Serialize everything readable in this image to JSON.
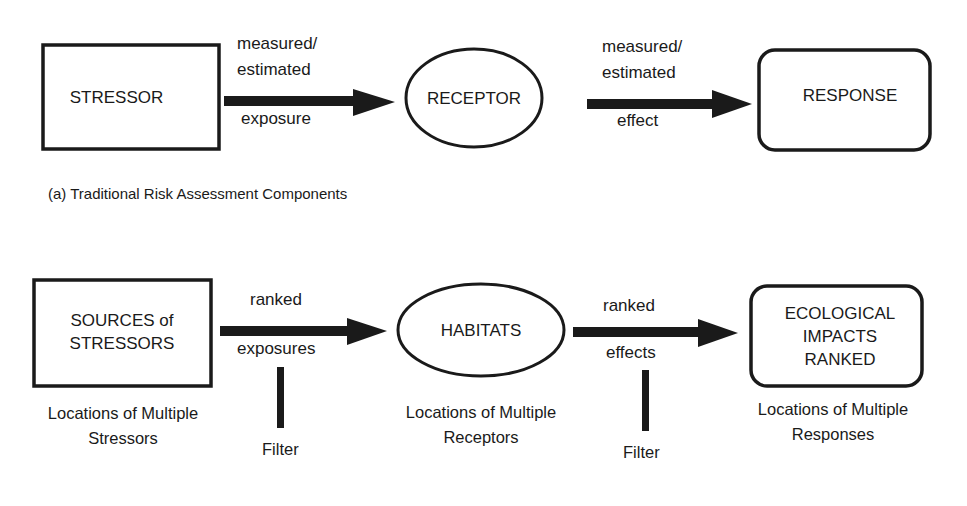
{
  "panel_a": {
    "caption": "(a) Traditional Risk Assessment Components",
    "nodes": {
      "stressor": "STRESSOR",
      "receptor": "RECEPTOR",
      "response": "RESPONSE"
    },
    "edges": {
      "exposure": {
        "top1": "measured/",
        "top2": "estimated",
        "bottom": "exposure"
      },
      "effect": {
        "top1": "measured/",
        "top2": "estimated",
        "bottom": "effect"
      }
    }
  },
  "panel_b": {
    "nodes": {
      "sources": {
        "line1": "SOURCES of",
        "line2": "STRESSORS"
      },
      "habitats": "HABITATS",
      "impacts": {
        "line1": "ECOLOGICAL",
        "line2": "IMPACTS",
        "line3": "RANKED"
      }
    },
    "edges": {
      "exposures": {
        "top": "ranked",
        "bottom": "exposures",
        "filter": "Filter"
      },
      "effects": {
        "top": "ranked",
        "bottom": "effects",
        "filter": "Filter"
      }
    },
    "sublabels": {
      "stressors": {
        "line1": "Locations of Multiple",
        "line2": "Stressors"
      },
      "receptors": {
        "line1": "Locations of Multiple",
        "line2": "Receptors"
      },
      "responses": {
        "line1": "Locations of Multiple",
        "line2": "Responses"
      }
    }
  },
  "colors": {
    "stroke": "#1a1a1a",
    "background": "#ffffff"
  }
}
